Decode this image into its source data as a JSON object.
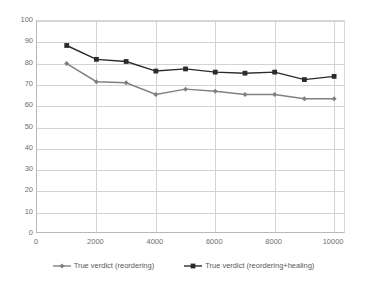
{
  "chart_data": {
    "type": "line",
    "title": "",
    "xlabel": "",
    "ylabel": "",
    "xlim": [
      0,
      10400
    ],
    "ylim": [
      0,
      100
    ],
    "grid": true,
    "legend_position": "bottom",
    "x": [
      1000,
      2000,
      3000,
      4000,
      5000,
      6000,
      7000,
      8000,
      9000,
      10000
    ],
    "xticks": [
      0,
      2000,
      4000,
      6000,
      8000,
      10000
    ],
    "xtick_labels": [
      "0",
      "2000",
      "4000",
      "6000",
      "8000",
      "10000"
    ],
    "yticks": [
      0,
      10,
      20,
      30,
      40,
      50,
      60,
      70,
      80,
      90,
      100
    ],
    "ytick_labels": [
      "0",
      "10",
      "20",
      "30",
      "40",
      "50",
      "60",
      "70",
      "80",
      "90",
      "100"
    ],
    "series": [
      {
        "name": "True verdict (reordering)",
        "color": "#808080",
        "marker": "diamond",
        "values": [
          80,
          71.5,
          71,
          65.5,
          68,
          67,
          65.5,
          65.5,
          63.5,
          63.5
        ]
      },
      {
        "name": "True verdict (reordering+healing)",
        "color": "#2b2b2b",
        "marker": "square",
        "values": [
          88.5,
          82,
          81,
          76.5,
          77.5,
          76,
          75.5,
          76,
          72.5,
          74
        ]
      }
    ]
  },
  "legend": {
    "items": [
      {
        "label": "True verdict (reordering)"
      },
      {
        "label": "True verdict (reordering+healing)"
      }
    ]
  },
  "colors": {
    "gridline": "#d0d4d8",
    "axis": "#b8b8b8",
    "tick_text": "#6f6f6f",
    "legend_text": "#595959",
    "background": "#ffffff"
  }
}
